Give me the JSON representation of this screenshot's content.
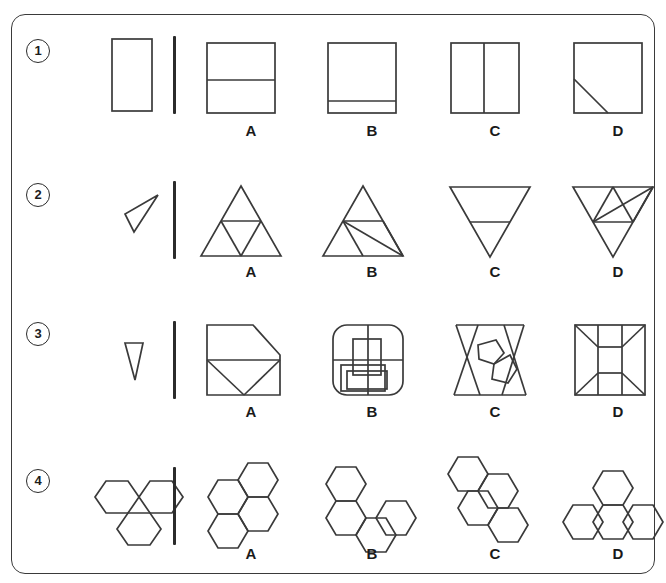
{
  "page": {
    "border_color": "#3a3a3a",
    "line_color": "#3a3a3a",
    "text_color": "#1a1a1a",
    "background": "#ffffff"
  },
  "option_labels": [
    "A",
    "B",
    "C",
    "D"
  ],
  "rows": [
    {
      "number": "1",
      "prompt_name": "vertical-rectangle",
      "options": [
        {
          "label": "A",
          "name": "square-split-horizontal-middle"
        },
        {
          "label": "B",
          "name": "square-split-horizontal-low"
        },
        {
          "label": "C",
          "name": "square-split-vertical"
        },
        {
          "label": "D",
          "name": "square-with-diagonal-corner"
        }
      ]
    },
    {
      "number": "2",
      "prompt_name": "thin-dart-triangle",
      "options": [
        {
          "label": "A",
          "name": "triangle-subdivided-four"
        },
        {
          "label": "B",
          "name": "triangle-with-crossing-lines"
        },
        {
          "label": "C",
          "name": "inverted-triangle-with-midline"
        },
        {
          "label": "D",
          "name": "inverted-triangle-with-crossing-lines"
        }
      ]
    },
    {
      "number": "3",
      "prompt_name": "narrow-downward-triangle",
      "options": [
        {
          "label": "A",
          "name": "envelope-pentagon-shape"
        },
        {
          "label": "B",
          "name": "rounded-square-with-overlapping-rectangles"
        },
        {
          "label": "C",
          "name": "hourglass-with-pentagons"
        },
        {
          "label": "D",
          "name": "square-with-inner-rectangle-and-diagonals"
        }
      ]
    },
    {
      "number": "4",
      "prompt_name": "three-hexagon-v-cluster",
      "options": [
        {
          "label": "A",
          "name": "four-hexagon-cluster"
        },
        {
          "label": "B",
          "name": "four-hexagon-zigzag"
        },
        {
          "label": "C",
          "name": "four-hexagon-diagonal-chain"
        },
        {
          "label": "D",
          "name": "four-hexagon-tee-cluster"
        }
      ]
    }
  ]
}
